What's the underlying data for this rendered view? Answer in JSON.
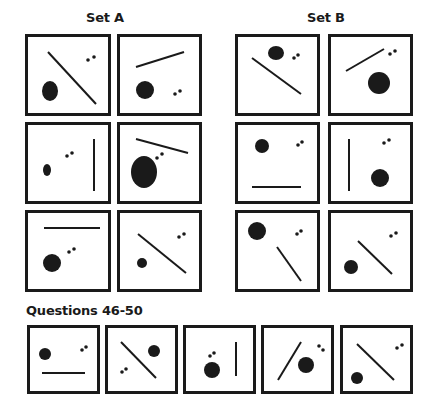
{
  "set_a": {
    "title": "Set A",
    "panels": [
      {
        "box": [
          25,
          34,
          86,
          82
        ],
        "line": [
          20,
          15,
          68,
          67
        ],
        "blob": {
          "cx": 22,
          "cy": 54,
          "rx": 8,
          "ry": 10
        },
        "dots": [
          [
            60,
            23
          ],
          [
            66,
            20
          ]
        ]
      },
      {
        "box": [
          117,
          34,
          85,
          82
        ],
        "line": [
          16,
          30,
          64,
          15
        ],
        "blob": {
          "cx": 25,
          "cy": 53,
          "rx": 9,
          "ry": 9
        },
        "dots": [
          [
            55,
            57
          ],
          [
            60,
            54
          ]
        ]
      },
      {
        "box": [
          25,
          122,
          86,
          82
        ],
        "line": [
          66,
          14,
          66,
          66
        ],
        "blob": {
          "cx": 19,
          "cy": 45,
          "rx": 4,
          "ry": 6
        },
        "dots": [
          [
            39,
            31
          ],
          [
            44,
            28
          ]
        ]
      },
      {
        "box": [
          117,
          122,
          85,
          82
        ],
        "line": [
          16,
          14,
          68,
          28
        ],
        "blob": {
          "cx": 24,
          "cy": 47,
          "rx": 13,
          "ry": 16
        },
        "dots": [
          [
            37,
            33
          ],
          [
            42,
            29
          ]
        ]
      },
      {
        "box": [
          25,
          210,
          86,
          82
        ],
        "line": [
          16,
          15,
          72,
          15
        ],
        "blob": {
          "cx": 24,
          "cy": 50,
          "rx": 9,
          "ry": 9
        },
        "dots": [
          [
            41,
            39
          ],
          [
            46,
            36
          ]
        ]
      },
      {
        "box": [
          117,
          210,
          85,
          82
        ],
        "line": [
          18,
          21,
          66,
          60
        ],
        "blob": {
          "cx": 22,
          "cy": 50,
          "rx": 5,
          "ry": 5
        },
        "dots": [
          [
            59,
            24
          ],
          [
            64,
            21
          ]
        ]
      }
    ]
  },
  "set_b": {
    "title": "Set B",
    "panels": [
      {
        "box": [
          235,
          34,
          85,
          82
        ],
        "line": [
          14,
          21,
          63,
          57
        ],
        "blob": {
          "cx": 38,
          "cy": 16,
          "rx": 8,
          "ry": 7
        },
        "dots": [
          [
            56,
            21
          ],
          [
            60,
            18
          ]
        ]
      },
      {
        "box": [
          328,
          34,
          85,
          82
        ],
        "line": [
          15,
          34,
          53,
          12
        ],
        "blob": {
          "cx": 48,
          "cy": 46,
          "rx": 11,
          "ry": 11
        },
        "dots": [
          [
            59,
            17
          ],
          [
            64,
            14
          ]
        ]
      },
      {
        "box": [
          235,
          122,
          85,
          82
        ],
        "line": [
          14,
          62,
          63,
          62
        ],
        "blob": {
          "cx": 24,
          "cy": 21,
          "rx": 7,
          "ry": 7
        },
        "dots": [
          [
            60,
            20
          ],
          [
            64,
            17
          ]
        ]
      },
      {
        "box": [
          328,
          122,
          85,
          82
        ],
        "line": [
          18,
          14,
          18,
          66
        ],
        "blob": {
          "cx": 49,
          "cy": 53,
          "rx": 9,
          "ry": 9
        },
        "dots": [
          [
            53,
            18
          ],
          [
            58,
            15
          ]
        ]
      },
      {
        "box": [
          235,
          210,
          85,
          82
        ],
        "line": [
          39,
          34,
          63,
          68
        ],
        "blob": {
          "cx": 19,
          "cy": 18,
          "rx": 9,
          "ry": 9
        },
        "dots": [
          [
            59,
            21
          ],
          [
            63,
            18
          ]
        ]
      },
      {
        "box": [
          328,
          210,
          85,
          82
        ],
        "line": [
          27,
          28,
          61,
          61
        ],
        "blob": {
          "cx": 20,
          "cy": 54,
          "rx": 7,
          "ry": 7
        },
        "dots": [
          [
            60,
            23
          ],
          [
            65,
            20
          ]
        ]
      }
    ]
  },
  "questions": {
    "title": "Questions 46-50",
    "panels": [
      {
        "box": [
          27,
          325,
          73,
          69
        ],
        "line": [
          12,
          45,
          55,
          45
        ],
        "blob": {
          "cx": 15,
          "cy": 26,
          "rx": 6,
          "ry": 6
        },
        "dots": [
          [
            52,
            22
          ],
          [
            56,
            19
          ]
        ]
      },
      {
        "box": [
          105,
          325,
          73,
          69
        ],
        "line": [
          13,
          14,
          48,
          50
        ],
        "blob": {
          "cx": 46,
          "cy": 23,
          "rx": 6,
          "ry": 6
        },
        "dots": [
          [
            14,
            44
          ],
          [
            18,
            41
          ]
        ]
      },
      {
        "box": [
          183,
          325,
          73,
          69
        ],
        "line": [
          50,
          14,
          50,
          48
        ],
        "blob": {
          "cx": 26,
          "cy": 42,
          "rx": 8,
          "ry": 8
        },
        "dots": [
          [
            24,
            28
          ],
          [
            28,
            25
          ]
        ]
      },
      {
        "box": [
          261,
          325,
          73,
          69
        ],
        "line": [
          14,
          52,
          37,
          14
        ],
        "blob": {
          "cx": 42,
          "cy": 37,
          "rx": 8,
          "ry": 8
        },
        "dots": [
          [
            55,
            18
          ],
          [
            59,
            22
          ]
        ]
      },
      {
        "box": [
          340,
          325,
          73,
          69
        ],
        "line": [
          14,
          16,
          51,
          52
        ],
        "blob": {
          "cx": 14,
          "cy": 50,
          "rx": 6,
          "ry": 6
        },
        "dots": [
          [
            54,
            20
          ],
          [
            59,
            17
          ]
        ]
      }
    ]
  },
  "colors": {
    "ink": "#1a1a1a",
    "background": "#ffffff"
  }
}
